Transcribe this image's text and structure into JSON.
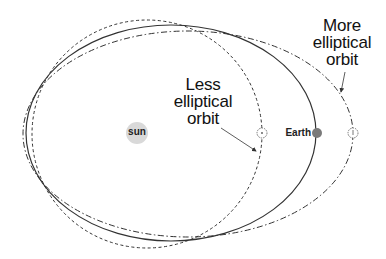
{
  "diagram": {
    "colors": {
      "background": "#ffffff",
      "line": "#333333",
      "sun_fill": "#d9d9d9",
      "earth_fill": "#7a7a7a",
      "text": "#111111"
    },
    "labels": {
      "sun": "sun",
      "earth": "Earth",
      "less_elliptical": [
        "Less",
        "elliptical",
        "orbit"
      ],
      "more_elliptical": [
        "More",
        "elliptical",
        "orbit"
      ]
    },
    "orbits": [
      {
        "name": "less-elliptical-orbit",
        "style": "dashed",
        "cx": 147,
        "cy": 134,
        "rx": 115,
        "ry": 114
      },
      {
        "name": "earth-orbit",
        "style": "solid",
        "cx": 171,
        "cy": 133,
        "rx": 145,
        "ry": 108
      },
      {
        "name": "more-elliptical-orbit",
        "style": "dash-dot",
        "cx": 188,
        "cy": 134,
        "rx": 165,
        "ry": 103
      }
    ],
    "bodies": {
      "sun": {
        "cx": 137,
        "cy": 133,
        "r": 11
      },
      "earth": {
        "cx": 317,
        "cy": 133,
        "r": 5
      },
      "less_marker": {
        "cx": 262,
        "cy": 133,
        "r": 5
      },
      "more_marker": {
        "cx": 353,
        "cy": 133,
        "r": 5
      }
    }
  }
}
